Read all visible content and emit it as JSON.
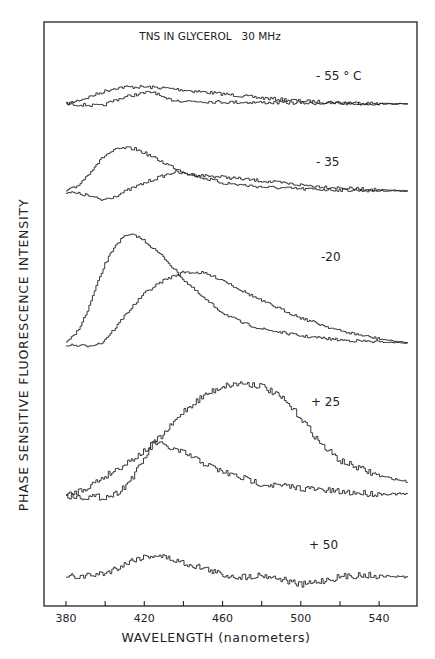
{
  "chart_data": {
    "type": "line",
    "title": "TNS IN GLYCEROL   30 MHz",
    "xlabel": "WAVELENGTH (nanometers)",
    "ylabel": "PHASE SENSITIVE FLUORESCENCE INTENSITY",
    "xlim": [
      380,
      555
    ],
    "x_ticks": [
      380,
      400,
      420,
      440,
      460,
      480,
      500,
      520,
      540
    ],
    "x_tick_labels": [
      "380",
      "420",
      "460",
      "500",
      "540"
    ],
    "ylim": "arbitrary units (vertically offset traces)",
    "grid": false,
    "legend": "none (temperature labels annotated next to each trace pair)",
    "panels": [
      {
        "label": "- 55 ° C",
        "temperature_c": -55,
        "baseline_px": 104,
        "series": [
          {
            "name": "phase A",
            "x": [
              380,
              390,
              400,
              405,
              410,
              420,
              430,
              440,
              460,
              480,
              500,
              520,
              540,
              555
            ],
            "y": [
              0,
              6,
              13,
              16,
              17,
              17,
              16,
              14,
              10,
              6,
              3,
              1.5,
              0.5,
              0
            ]
          },
          {
            "name": "phase B",
            "x": [
              380,
              390,
              398,
              405,
              412,
              420,
              425,
              430,
              440,
              460,
              480,
              500,
              520,
              540,
              555
            ],
            "y": [
              0,
              -1,
              -2,
              4,
              8,
              11,
              12,
              5,
              3,
              2,
              1.5,
              1,
              0.5,
              0.2,
              0
            ]
          }
        ]
      },
      {
        "label": "- 35",
        "temperature_c": -35,
        "baseline_px": 191,
        "series": [
          {
            "name": "phase A",
            "x": [
              380,
              385,
              390,
              395,
              400,
              405,
              410,
              415,
              420,
              430,
              440,
              450,
              460,
              480,
              500,
              520,
              540,
              555
            ],
            "y": [
              0,
              4,
              14,
              26,
              36,
              41,
              43,
              42,
              38,
              28,
              19,
              13,
              8,
              4,
              2,
              1,
              0.3,
              0
            ]
          },
          {
            "name": "phase B",
            "x": [
              380,
              390,
              398,
              405,
              415,
              425,
              435,
              445,
              460,
              480,
              500,
              520,
              540,
              555
            ],
            "y": [
              -1,
              -4,
              -9,
              -5,
              4,
              12,
              19,
              16,
              14,
              10,
              6,
              3,
              1,
              0
            ]
          }
        ]
      },
      {
        "label": "-20",
        "temperature_c": -20,
        "baseline_px": 343,
        "series": [
          {
            "name": "phase A",
            "x": [
              380,
              385,
              390,
              395,
              400,
              405,
              410,
              415,
              420,
              430,
              440,
              450,
              460,
              470,
              480,
              500,
              520,
              540,
              555
            ],
            "y": [
              0,
              10,
              28,
              55,
              80,
              98,
              107,
              108,
              102,
              85,
              63,
              45,
              30,
              20,
              14,
              7,
              3,
              1,
              0
            ]
          },
          {
            "name": "phase B",
            "x": [
              380,
              390,
              398,
              405,
              410,
              420,
              430,
              440,
              450,
              460,
              470,
              480,
              500,
              520,
              540,
              555
            ],
            "y": [
              -2,
              -3,
              0,
              15,
              28,
              50,
              63,
              71,
              70,
              63,
              52,
              42,
              25,
              12,
              4,
              0
            ]
          }
        ]
      },
      {
        "label": "+ 25",
        "temperature_c": 25,
        "baseline_px": 496,
        "series": [
          {
            "name": "phase A",
            "x": [
              380,
              390,
              400,
              410,
              420,
              430,
              440,
              450,
              460,
              470,
              480,
              490,
              500,
              510,
              520,
              540,
              555
            ],
            "y": [
              0,
              8,
              20,
              32,
              45,
              62,
              85,
              100,
              110,
              113,
              110,
              98,
              78,
              52,
              35,
              20,
              14
            ]
          },
          {
            "name": "phase B",
            "x": [
              380,
              390,
              400,
              405,
              410,
              415,
              420,
              425,
              430,
              440,
              450,
              460,
              470,
              480,
              490,
              500,
              520,
              540,
              555
            ],
            "y": [
              0,
              -1,
              -1,
              2,
              10,
              22,
              38,
              54,
              50,
              43,
              33,
              24,
              18,
              12,
              10,
              8,
              4,
              2,
              2
            ]
          }
        ]
      },
      {
        "label": "+ 50",
        "temperature_c": 50,
        "baseline_px": 577,
        "series": [
          {
            "name": "single trace",
            "x": [
              380,
              390,
              400,
              410,
              415,
              420,
              425,
              430,
              440,
              450,
              460,
              470,
              480,
              490,
              500,
              510,
              520,
              530,
              540,
              555
            ],
            "y": [
              0,
              1,
              4,
              13,
              18,
              20,
              22,
              20,
              14,
              9,
              2,
              0,
              2,
              -2,
              -8,
              -4,
              0,
              2,
              1,
              0
            ]
          }
        ]
      }
    ]
  },
  "labels": {
    "title": "TNS IN GLYCEROL   30 MHz",
    "xlabel": "WAVELENGTH (nanometers)",
    "ylabel": "PHASE SENSITIVE FLUORESCENCE INTENSITY",
    "ticks": [
      "380",
      "420",
      "460",
      "500",
      "540"
    ],
    "temp_55": "- 55 ° C",
    "temp_35": "- 35",
    "temp_20": "-20",
    "temp_25": "+ 25",
    "temp_50": "+ 50"
  }
}
